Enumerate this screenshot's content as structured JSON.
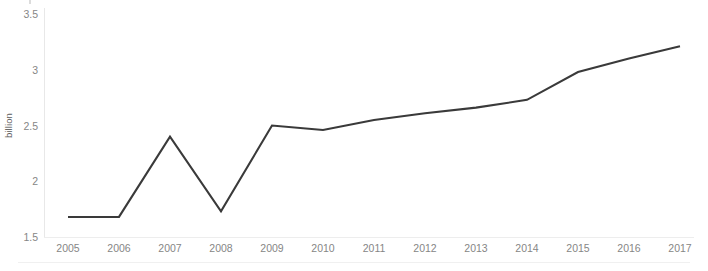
{
  "chart_data": {
    "type": "line",
    "title": "",
    "subtitle": "",
    "xlabel": "",
    "ylabel": "billion",
    "categories": [
      "2005",
      "2006",
      "2007",
      "2008",
      "2009",
      "2010",
      "2011",
      "2012",
      "2013",
      "2014",
      "2015",
      "2016",
      "2017"
    ],
    "values": [
      1.68,
      1.68,
      2.4,
      1.73,
      2.5,
      2.46,
      2.55,
      2.61,
      2.66,
      2.73,
      2.98,
      3.1,
      3.21
    ],
    "series": [
      {
        "name": "billion",
        "values": [
          1.68,
          1.68,
          2.4,
          1.73,
          2.5,
          2.46,
          2.55,
          2.61,
          2.66,
          2.73,
          2.98,
          3.1,
          3.21
        ]
      }
    ],
    "ylim": [
      1.5,
      3.5
    ],
    "yticks": [
      "1.5",
      "2",
      "2.5",
      "3",
      "3.5"
    ],
    "ytick_values": [
      1.5,
      2,
      2.5,
      3,
      3.5
    ],
    "xticks": [
      "2005",
      "2006",
      "2007",
      "2008",
      "2009",
      "2010",
      "2011",
      "2012",
      "2013",
      "2014",
      "2015",
      "2016",
      "2017"
    ],
    "grid": false,
    "legend": false,
    "legend_position": "none",
    "line_color": "#3a3a3a",
    "axis_color": "#e8e8e8",
    "tick_label_color": "#868686",
    "axis_title_color": "#5a5a5a",
    "background_color": "#ffffff",
    "markers": false
  }
}
